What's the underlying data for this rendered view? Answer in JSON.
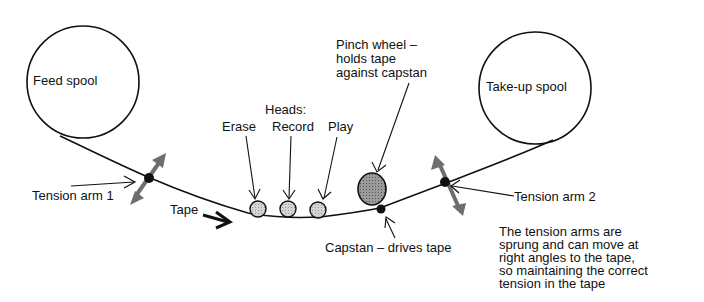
{
  "diagram": {
    "type": "tape-transport-mechanism",
    "labels": {
      "feed_spool": "Feed spool",
      "takeup_spool": "Take-up spool",
      "tension_arm_1": "Tension arm 1",
      "tension_arm_2": "Tension arm 2",
      "tape": "Tape",
      "heads_title": "Heads:",
      "head_erase": "Erase",
      "head_record": "Record",
      "head_play": "Play",
      "pinch_wheel": [
        "Pinch wheel –",
        "holds tape",
        "against capstan"
      ],
      "capstan": "Capstan – drives tape",
      "note": [
        "The tension arms are",
        "sprung and can move at",
        "right angles to the tape,",
        "so maintaining the correct",
        "tension in the tape"
      ]
    },
    "colors": {
      "line": "#111111",
      "head_fill": "#c8c8c8",
      "pinch_fill": "#8c8c8c",
      "arm_arrow": "#6e6e6e"
    }
  }
}
